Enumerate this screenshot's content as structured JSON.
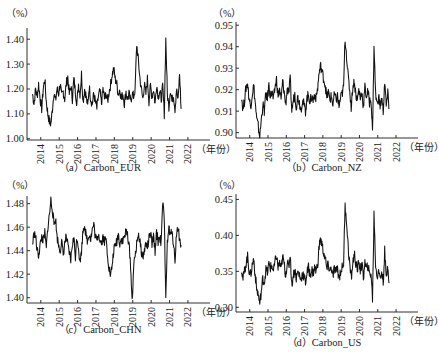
{
  "chart_data": [
    {
      "id": "a",
      "type": "line",
      "title": "（a）Carbon_EUR",
      "unit_label": "（%）",
      "xlabel": "（年份）",
      "x_tick_labels": [
        "2014",
        "2015",
        "2016",
        "2017",
        "2018",
        "2019",
        "2020",
        "2021",
        "2022"
      ],
      "y_tick_labels": [
        "1.00",
        "1.10",
        "1.20",
        "1.30",
        "1.40"
      ],
      "y_ticks": [
        1.0,
        1.1,
        1.2,
        1.3,
        1.4
      ],
      "ylim": [
        0.995,
        1.445
      ],
      "xlim": [
        2013.25,
        2023.2
      ],
      "grid": false,
      "series": [
        {
          "name": "Carbon_EUR",
          "x_start": 2013.55,
          "x_step": 0.0833,
          "values": [
            1.18,
            1.14,
            1.2,
            1.17,
            1.22,
            1.16,
            1.12,
            1.2,
            1.24,
            1.15,
            1.1,
            1.07,
            1.06,
            1.12,
            1.19,
            1.15,
            1.2,
            1.18,
            1.22,
            1.17,
            1.19,
            1.16,
            1.22,
            1.25,
            1.18,
            1.21,
            1.16,
            1.24,
            1.19,
            1.14,
            1.22,
            1.18,
            1.26,
            1.15,
            1.2,
            1.17,
            1.13,
            1.21,
            1.16,
            1.14,
            1.18,
            1.15,
            1.12,
            1.17,
            1.19,
            1.14,
            1.2,
            1.16,
            1.18,
            1.15,
            1.19,
            1.22,
            1.26,
            1.28,
            1.24,
            1.22,
            1.18,
            1.2,
            1.16,
            1.18,
            1.14,
            1.19,
            1.16,
            1.18,
            1.15,
            1.18,
            1.17,
            1.2,
            1.38,
            1.32,
            1.25,
            1.2,
            1.16,
            1.22,
            1.18,
            1.24,
            1.15,
            1.21,
            1.17,
            1.2,
            1.14,
            1.22,
            1.17,
            1.19,
            1.16,
            1.21,
            1.1,
            1.4,
            1.18,
            1.13,
            1.2,
            1.15,
            1.18,
            1.12,
            1.2,
            1.15,
            1.26,
            1.12
          ]
        }
      ]
    },
    {
      "id": "b",
      "type": "line",
      "title": "（b）Carbon_NZ",
      "unit_label": "（%）",
      "xlabel": "（年份）",
      "x_tick_labels": [
        "2014",
        "2015",
        "2016",
        "2017",
        "2018",
        "2019",
        "2020",
        "2021",
        "2022"
      ],
      "y_tick_labels": [
        "0.90",
        "0.91",
        "0.92",
        "0.93",
        "0.94",
        "0.95"
      ],
      "y_ticks": [
        0.9,
        0.91,
        0.92,
        0.93,
        0.94,
        0.95
      ],
      "ylim": [
        0.8975,
        0.9515
      ],
      "xlim": [
        2013.25,
        2023.2
      ],
      "grid": false,
      "series": [
        {
          "name": "Carbon_NZ",
          "x_start": 2013.55,
          "x_step": 0.0833,
          "values": [
            0.917,
            0.911,
            0.915,
            0.921,
            0.923,
            0.916,
            0.912,
            0.918,
            0.922,
            0.914,
            0.906,
            0.903,
            0.898,
            0.906,
            0.913,
            0.91,
            0.918,
            0.916,
            0.922,
            0.917,
            0.919,
            0.915,
            0.921,
            0.925,
            0.917,
            0.92,
            0.915,
            0.924,
            0.919,
            0.913,
            0.921,
            0.918,
            0.925,
            0.91,
            0.915,
            0.918,
            0.912,
            0.917,
            0.914,
            0.911,
            0.915,
            0.913,
            0.91,
            0.916,
            0.918,
            0.914,
            0.917,
            0.915,
            0.918,
            0.916,
            0.921,
            0.928,
            0.931,
            0.928,
            0.925,
            0.922,
            0.916,
            0.919,
            0.915,
            0.917,
            0.913,
            0.918,
            0.915,
            0.917,
            0.912,
            0.916,
            0.918,
            0.921,
            0.944,
            0.936,
            0.926,
            0.92,
            0.912,
            0.921,
            0.924,
            0.918,
            0.915,
            0.92,
            0.916,
            0.919,
            0.912,
            0.921,
            0.917,
            0.919,
            0.914,
            0.916,
            0.9,
            0.941,
            0.918,
            0.913,
            0.917,
            0.912,
            0.916,
            0.91,
            0.924,
            0.912,
            0.918,
            0.911
          ]
        }
      ]
    },
    {
      "id": "c",
      "type": "line",
      "title": "（c）Carbon_CHN",
      "unit_label": "（%）",
      "xlabel": "（年份）",
      "x_tick_labels": [
        "2014",
        "2015",
        "2016",
        "2017",
        "2018",
        "2019",
        "2020",
        "2021",
        "2022"
      ],
      "y_tick_labels": [
        "1.40",
        "1.42",
        "1.44",
        "1.46",
        "1.48"
      ],
      "y_ticks": [
        1.4,
        1.42,
        1.44,
        1.46,
        1.48
      ],
      "ylim": [
        1.3955,
        1.4865
      ],
      "xlim": [
        2013.25,
        2023.2
      ],
      "grid": false,
      "series": [
        {
          "name": "Carbon_CHN",
          "x_start": 2013.55,
          "x_step": 0.0833,
          "values": [
            1.445,
            1.455,
            1.452,
            1.44,
            1.436,
            1.445,
            1.452,
            1.448,
            1.455,
            1.442,
            1.46,
            1.47,
            1.483,
            1.475,
            1.462,
            1.468,
            1.452,
            1.445,
            1.44,
            1.448,
            1.436,
            1.446,
            1.452,
            1.444,
            1.438,
            1.432,
            1.446,
            1.45,
            1.435,
            1.452,
            1.443,
            1.43,
            1.44,
            1.458,
            1.462,
            1.452,
            1.448,
            1.455,
            1.45,
            1.458,
            1.462,
            1.452,
            1.448,
            1.455,
            1.45,
            1.446,
            1.452,
            1.448,
            1.45,
            1.436,
            1.425,
            1.418,
            1.428,
            1.44,
            1.444,
            1.448,
            1.454,
            1.446,
            1.45,
            1.448,
            1.452,
            1.456,
            1.454,
            1.445,
            1.428,
            1.397,
            1.425,
            1.436,
            1.445,
            1.455,
            1.448,
            1.44,
            1.434,
            1.44,
            1.446,
            1.443,
            1.45,
            1.455,
            1.445,
            1.452,
            1.44,
            1.455,
            1.448,
            1.452,
            1.446,
            1.482,
            1.465,
            1.404,
            1.445,
            1.46,
            1.452,
            1.458,
            1.446,
            1.432,
            1.455,
            1.46,
            1.45,
            1.445
          ]
        }
      ]
    },
    {
      "id": "d",
      "type": "line",
      "title": "（d）Carbon_US",
      "unit_label": "（%）",
      "xlabel": "（年份）",
      "x_tick_labels": [
        "2014",
        "2015",
        "2016",
        "2017",
        "2018",
        "2019",
        "2020",
        "2021",
        "2022"
      ],
      "y_tick_labels": [
        "0.30",
        "0.35",
        "0.40",
        "0.45"
      ],
      "y_ticks": [
        0.3,
        0.35,
        0.4,
        0.45
      ],
      "ylim": [
        0.2935,
        0.4575
      ],
      "xlim": [
        2013.25,
        2023.2
      ],
      "grid": false,
      "series": [
        {
          "name": "Carbon_US",
          "x_start": 2013.55,
          "x_step": 0.0833,
          "values": [
            0.355,
            0.34,
            0.35,
            0.362,
            0.37,
            0.352,
            0.345,
            0.358,
            0.368,
            0.345,
            0.325,
            0.318,
            0.305,
            0.322,
            0.34,
            0.335,
            0.352,
            0.348,
            0.36,
            0.355,
            0.358,
            0.35,
            0.362,
            0.372,
            0.355,
            0.362,
            0.352,
            0.37,
            0.36,
            0.345,
            0.362,
            0.355,
            0.375,
            0.33,
            0.345,
            0.352,
            0.34,
            0.35,
            0.345,
            0.338,
            0.348,
            0.342,
            0.335,
            0.348,
            0.355,
            0.345,
            0.352,
            0.348,
            0.355,
            0.35,
            0.36,
            0.385,
            0.395,
            0.385,
            0.375,
            0.368,
            0.352,
            0.36,
            0.35,
            0.356,
            0.342,
            0.355,
            0.348,
            0.354,
            0.34,
            0.35,
            0.355,
            0.362,
            0.44,
            0.42,
            0.385,
            0.36,
            0.34,
            0.36,
            0.375,
            0.362,
            0.35,
            0.365,
            0.352,
            0.36,
            0.342,
            0.362,
            0.352,
            0.358,
            0.345,
            0.348,
            0.312,
            0.43,
            0.36,
            0.342,
            0.355,
            0.338,
            0.35,
            0.335,
            0.378,
            0.338,
            0.36,
            0.335
          ]
        }
      ]
    }
  ],
  "layout": {
    "panels": [
      {
        "id": "a",
        "axis_x": 27,
        "axis_right": 210,
        "plot_top": 28,
        "axis_y": 140,
        "caption_x": 100,
        "caption_y": 170,
        "unit_x": 6,
        "unit_y": 17
      },
      {
        "id": "b",
        "axis_x": 236,
        "axis_right": 418,
        "plot_top": 22,
        "axis_y": 138,
        "caption_x": 324,
        "caption_y": 170,
        "unit_x": 213,
        "unit_y": 17
      },
      {
        "id": "c",
        "axis_x": 27,
        "axis_right": 210,
        "plot_top": 196,
        "axis_y": 303,
        "caption_x": 100,
        "caption_y": 332,
        "unit_x": 6,
        "unit_y": 189
      },
      {
        "id": "d",
        "axis_x": 236,
        "axis_right": 418,
        "plot_top": 194,
        "axis_y": 312,
        "caption_x": 324,
        "caption_y": 345,
        "unit_x": 213,
        "unit_y": 189
      }
    ]
  }
}
